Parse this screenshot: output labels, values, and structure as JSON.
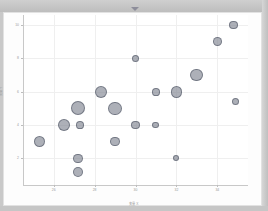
{
  "window": {
    "caret_icon": "chevron-down-icon"
  },
  "chart_data": {
    "type": "scatter",
    "title": "散布图：三变量气泡图",
    "xlabel": "变量 X",
    "ylabel": "变量 Y",
    "xlim": [
      24.5,
      35.5
    ],
    "ylim": [
      0.4,
      10.6
    ],
    "xticks": [
      26,
      28,
      30,
      32,
      34
    ],
    "yticks": [
      2,
      4,
      6,
      8,
      10
    ],
    "grid": true,
    "legend": "none",
    "size_encodes": "bubble-size",
    "points": [
      {
        "x": 25.3,
        "y": 3.0,
        "size": 22
      },
      {
        "x": 26.5,
        "y": 4.0,
        "size": 26
      },
      {
        "x": 27.2,
        "y": 5.0,
        "size": 34
      },
      {
        "x": 27.2,
        "y": 2.0,
        "size": 15
      },
      {
        "x": 27.2,
        "y": 1.2,
        "size": 17
      },
      {
        "x": 27.3,
        "y": 4.0,
        "size": 10
      },
      {
        "x": 28.3,
        "y": 6.0,
        "size": 24
      },
      {
        "x": 29.0,
        "y": 5.0,
        "size": 31
      },
      {
        "x": 29.0,
        "y": 3.0,
        "size": 14
      },
      {
        "x": 30.0,
        "y": 8.0,
        "size": 9
      },
      {
        "x": 30.0,
        "y": 4.0,
        "size": 13
      },
      {
        "x": 31.0,
        "y": 6.0,
        "size": 10
      },
      {
        "x": 31.0,
        "y": 4.0,
        "size": 8
      },
      {
        "x": 32.0,
        "y": 6.0,
        "size": 23
      },
      {
        "x": 32.0,
        "y": 2.0,
        "size": 6
      },
      {
        "x": 33.0,
        "y": 7.0,
        "size": 28
      },
      {
        "x": 34.0,
        "y": 9.0,
        "size": 13
      },
      {
        "x": 34.8,
        "y": 10.0,
        "size": 13
      },
      {
        "x": 34.9,
        "y": 5.4,
        "size": 9
      }
    ]
  }
}
